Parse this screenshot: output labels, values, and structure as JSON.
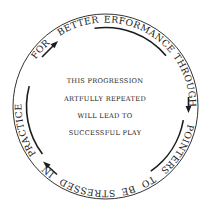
{
  "diagram": {
    "type": "circular-progression",
    "colors": {
      "ink": "#1c1c1c",
      "background": "#ffffff"
    },
    "ring_words": [
      {
        "id": "for",
        "text": "FOR",
        "offset": "86.5%"
      },
      {
        "id": "better",
        "text": "BETTER",
        "offset": "94.5%"
      },
      {
        "id": "performance",
        "text": "PERFORMANCE",
        "offset": "5.5%",
        "underlined": true
      },
      {
        "id": "through",
        "text": "THROUGH",
        "offset": "19.5%"
      },
      {
        "id": "pointers",
        "text": "POINTERS",
        "offset": "33.5%",
        "underlined": true
      },
      {
        "id": "to",
        "text": "TO",
        "offset": "42.5%"
      },
      {
        "id": "be",
        "text": "BE",
        "offset": "46.5%"
      },
      {
        "id": "stressed",
        "text": "STRESSED",
        "offset": "53.5%"
      },
      {
        "id": "in",
        "text": "IN",
        "offset": "61.5%"
      },
      {
        "id": "practice",
        "text": "PRACTICE",
        "offset": "70.5%",
        "underlined": true
      }
    ],
    "arrows": [
      {
        "id": "arrow-for-to-better",
        "from": "FOR",
        "to": "BETTER"
      },
      {
        "id": "arrow-through-to-pointers",
        "from": "THROUGH",
        "to": "POINTERS"
      },
      {
        "id": "arrow-in-to-practice",
        "from": "IN",
        "to": "PRACTICE"
      }
    ],
    "center_lines": [
      "THIS PROGRESSION",
      "ARTFULLY REPEATED",
      "WILL LEAD TO",
      "SUCCESSFUL PLAY"
    ]
  }
}
